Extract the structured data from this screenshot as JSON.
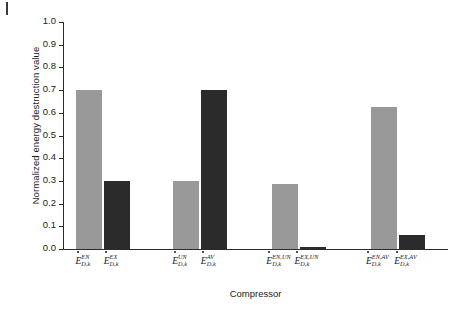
{
  "chart_data": {
    "type": "bar",
    "title": "",
    "xlabel": "Compressor",
    "ylabel": "Normalized energy destruction value",
    "ylim": [
      0.0,
      1.0
    ],
    "ytick_labels": [
      "0.0",
      "0.1",
      "0.2",
      "0.3",
      "0.4",
      "0.5",
      "0.6",
      "0.7",
      "0.8",
      "0.9",
      "1.0"
    ],
    "ytick_values": [
      0.0,
      0.1,
      0.2,
      0.3,
      0.4,
      0.5,
      0.6,
      0.7,
      0.8,
      0.9,
      1.0
    ],
    "grid": false,
    "legend": "none",
    "categories": [
      "E_D,k^EN",
      "E_D,k^EX",
      "E_D,k^UN",
      "E_D,k^AV",
      "E_D,k^EN,UN",
      "E_D,k^EX,UN",
      "E_D,k^EN,AV",
      "E_D,k^EX,AV"
    ],
    "values": [
      0.7,
      0.3,
      0.3,
      0.7,
      0.285,
      0.01,
      0.625,
      0.062
    ],
    "bar_colors": [
      "#999999",
      "#2b2b2b",
      "#999999",
      "#2b2b2b",
      "#999999",
      "#2b2b2b",
      "#999999",
      "#2b2b2b"
    ],
    "groups": [
      {
        "pair": [
          "EN",
          "EX"
        ]
      },
      {
        "pair": [
          "UN",
          "AV"
        ]
      },
      {
        "pair": [
          "EN,UN",
          "EX,UN"
        ]
      },
      {
        "pair": [
          "EN,AV",
          "EX,AV"
        ]
      }
    ],
    "bars": [
      {
        "base": "E",
        "sub": "D,k",
        "sup": "EN",
        "value": 0.7,
        "color": "#999999"
      },
      {
        "base": "E",
        "sub": "D,k",
        "sup": "EX",
        "value": 0.3,
        "color": "#2b2b2b"
      },
      {
        "base": "E",
        "sub": "D,k",
        "sup": "UN",
        "value": 0.3,
        "color": "#999999"
      },
      {
        "base": "E",
        "sub": "D,k",
        "sup": "AV",
        "value": 0.7,
        "color": "#2b2b2b"
      },
      {
        "base": "E",
        "sub": "D,k",
        "sup": "EN,UN",
        "value": 0.285,
        "color": "#999999"
      },
      {
        "base": "E",
        "sub": "D,k",
        "sup": "EX,UN",
        "value": 0.01,
        "color": "#2b2b2b"
      },
      {
        "base": "E",
        "sub": "D,k",
        "sup": "EN,AV",
        "value": 0.625,
        "color": "#999999"
      },
      {
        "base": "E",
        "sub": "D,k",
        "sup": "EX,AV",
        "value": 0.062,
        "color": "#2b2b2b"
      }
    ]
  },
  "axes": {
    "y_title": "Normalized energy destruction value",
    "x_title": "Compressor"
  },
  "colors": {
    "gray_series": "#999999",
    "dark_series": "#2b2b2b",
    "axis": "#2b2b2b",
    "text": "#1a1a1a",
    "background": "#ffffff"
  }
}
